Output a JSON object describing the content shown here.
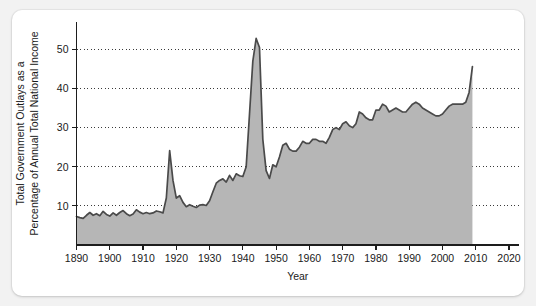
{
  "card": {
    "background": "#ffffff",
    "page_background": "#f2f2f2"
  },
  "chart_data": {
    "type": "area",
    "title": "",
    "xlabel": "Year",
    "ylabel": "Total Government Outlays as a Percentage of Annual Total National Income",
    "ylabel_lines": [
      "Total Government Outlays as a",
      "Percentage of Annual Total National Income"
    ],
    "xlim": [
      1890,
      2023
    ],
    "ylim": [
      0,
      57
    ],
    "xticks": [
      1890,
      1900,
      1910,
      1920,
      1930,
      1940,
      1950,
      1960,
      1970,
      1980,
      1990,
      2000,
      2010,
      2020
    ],
    "xtick_labels": [
      "1890",
      "1900",
      "1910",
      "1920",
      "1930",
      "1940",
      "1950",
      "1960",
      "1970",
      "1980",
      "1990",
      "2000",
      "2010",
      "2020"
    ],
    "yticks": [
      10,
      20,
      30,
      40,
      50
    ],
    "ytick_labels": [
      "10",
      "20",
      "30",
      "40",
      "50"
    ],
    "grid": "horizontal-dotted",
    "legend": "none",
    "series_color": "#4a4a4a",
    "fill_color": "#b6b6b6",
    "series": [
      {
        "name": "Total Government Outlays (% of National Income)",
        "x": [
          1890,
          1891,
          1892,
          1893,
          1894,
          1895,
          1896,
          1897,
          1898,
          1899,
          1900,
          1901,
          1902,
          1903,
          1904,
          1905,
          1906,
          1907,
          1908,
          1909,
          1910,
          1911,
          1912,
          1913,
          1914,
          1915,
          1916,
          1917,
          1918,
          1919,
          1920,
          1921,
          1922,
          1923,
          1924,
          1925,
          1926,
          1927,
          1928,
          1929,
          1930,
          1931,
          1932,
          1933,
          1934,
          1935,
          1936,
          1937,
          1938,
          1939,
          1940,
          1941,
          1942,
          1943,
          1944,
          1945,
          1946,
          1947,
          1948,
          1949,
          1950,
          1951,
          1952,
          1953,
          1954,
          1955,
          1956,
          1957,
          1958,
          1959,
          1960,
          1961,
          1962,
          1963,
          1964,
          1965,
          1966,
          1967,
          1968,
          1969,
          1970,
          1971,
          1972,
          1973,
          1974,
          1975,
          1976,
          1977,
          1978,
          1979,
          1980,
          1981,
          1982,
          1983,
          1984,
          1985,
          1986,
          1987,
          1988,
          1989,
          1990,
          1991,
          1992,
          1993,
          1994,
          1995,
          1996,
          1997,
          1998,
          1999,
          2000,
          2001,
          2002,
          2003,
          2004,
          2005,
          2006,
          2007,
          2008,
          2009
        ],
        "values": [
          7.3,
          7.0,
          6.8,
          7.6,
          8.3,
          7.6,
          8.0,
          7.5,
          8.6,
          7.8,
          7.4,
          8.2,
          7.6,
          8.3,
          8.8,
          8.0,
          7.5,
          7.9,
          9.0,
          8.4,
          8.0,
          8.3,
          8.0,
          8.2,
          8.7,
          8.5,
          8.2,
          12.0,
          24.1,
          16.5,
          12.0,
          12.6,
          10.9,
          9.8,
          10.3,
          9.9,
          9.6,
          10.2,
          10.3,
          10.1,
          11.3,
          13.6,
          15.8,
          16.5,
          16.9,
          16.1,
          17.8,
          16.5,
          18.2,
          17.7,
          17.5,
          20.0,
          33.5,
          47.0,
          52.8,
          50.5,
          27.0,
          19.0,
          17.0,
          20.5,
          20.0,
          22.5,
          25.5,
          26.0,
          24.5,
          24.0,
          24.0,
          25.0,
          26.5,
          26.0,
          26.0,
          27.0,
          27.0,
          26.5,
          26.5,
          26.0,
          27.5,
          29.5,
          30.0,
          29.5,
          31.0,
          31.5,
          30.5,
          30.0,
          31.0,
          34.0,
          33.5,
          32.5,
          32.0,
          32.0,
          34.5,
          34.5,
          36.0,
          35.5,
          34.0,
          34.5,
          35.0,
          34.5,
          34.0,
          34.0,
          35.0,
          36.0,
          36.5,
          36.0,
          35.0,
          34.5,
          34.0,
          33.5,
          33.0,
          33.0,
          33.5,
          34.5,
          35.5,
          36.0,
          36.0,
          36.0,
          36.0,
          36.5,
          39.0,
          45.6
        ]
      }
    ],
    "annotations": []
  }
}
